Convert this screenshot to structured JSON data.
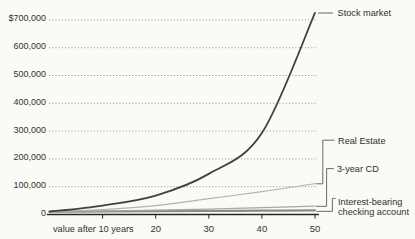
{
  "figure": {
    "background": "#fafaf7",
    "axis_color": "#26261f",
    "grid_color": "#8f8f8b",
    "text_color": "#33332f",
    "connector_color": "#5a5a54"
  },
  "chart_data": {
    "type": "line",
    "title": "",
    "xlabel": "value after 10 years",
    "ylabel": "",
    "x_unit": "years",
    "x": [
      0,
      10,
      20,
      30,
      40,
      50
    ],
    "x_tick_years": [
      10,
      20,
      30,
      40,
      50
    ],
    "x_tick_labels": [
      "value after 10 years",
      "20",
      "30",
      "40",
      "50"
    ],
    "y_ticks": [
      700000,
      600000,
      500000,
      400000,
      300000,
      200000,
      100000,
      0
    ],
    "y_tick_labels": [
      "$700,000",
      "600,000",
      "500,000",
      "400,000",
      "300,000",
      "200,000",
      "100,000",
      "0"
    ],
    "ylim": [
      0,
      725000
    ],
    "grid": "dotted-horizontal",
    "legend_position": "right-callouts",
    "series": [
      {
        "name": "Stock market",
        "values": [
          10000,
          32000,
          68000,
          146000,
          293000,
          725000
        ],
        "color": "#41413c",
        "width": 1.8
      },
      {
        "name": "Real Estate",
        "values": [
          10000,
          18000,
          32000,
          57000,
          82000,
          111000
        ],
        "color": "#b2b2ae",
        "width": 1.2
      },
      {
        "name": "3-year CD",
        "values": [
          10000,
          13000,
          16000,
          19500,
          24500,
          30000
        ],
        "color": "#a8a8a4",
        "width": 1.2
      },
      {
        "name": "Interest-bearing checking account",
        "label_lines": [
          "Interest-bearing",
          "checking account"
        ],
        "values": [
          10000,
          10800,
          11700,
          12700,
          13800,
          15000
        ],
        "color": "#8a8a86",
        "width": 2.2
      }
    ]
  }
}
